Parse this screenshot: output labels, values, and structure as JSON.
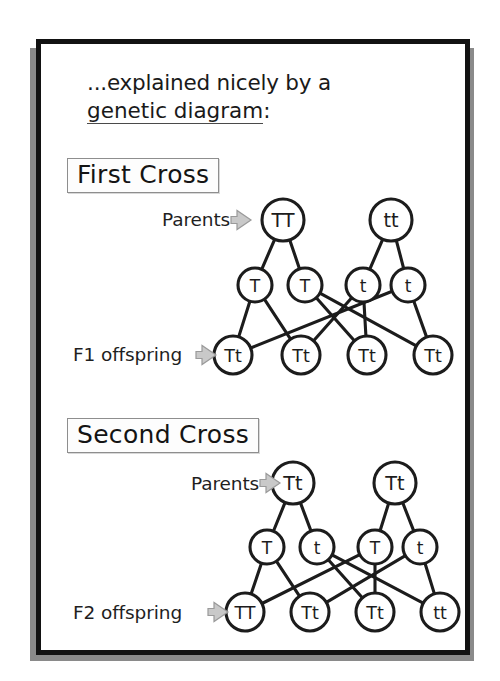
{
  "slide": {
    "headline_line1": "...explained nicely by a",
    "headline_line2": "genetic diagram",
    "headline_colon": ":",
    "sections": [
      {
        "id": "first",
        "title": "First  Cross"
      },
      {
        "id": "second",
        "title": "Second Cross"
      }
    ],
    "labels": {
      "parents_1": "Parents",
      "f1": "F1 offspring",
      "parents_2": "Parents",
      "f2": "F2 offspring"
    },
    "arrow_icon": "right-arrow-icon"
  },
  "colors": {
    "frame_border": "#121212",
    "frame_shadow": "#8a8a8a",
    "node_stroke": "#1c1c1c",
    "node_fill": "#ffffff",
    "arrow_fill": "#c9c9c9",
    "box_border": "#8e8e8e",
    "text": "#1a1a1a"
  },
  "chart_data": {
    "type": "diagram",
    "title": "genetic diagram",
    "crosses": [
      {
        "name": "First  Cross",
        "parents": [
          {
            "genotype": "TT",
            "x": 242,
            "y": 176
          },
          {
            "genotype": "tt",
            "x": 350,
            "y": 176
          }
        ],
        "gametes": [
          {
            "allele": "T",
            "x": 214,
            "y": 241
          },
          {
            "allele": "T",
            "x": 264,
            "y": 241
          },
          {
            "allele": "t",
            "x": 322,
            "y": 241
          },
          {
            "allele": "t",
            "x": 367,
            "y": 241
          }
        ],
        "offspring": [
          {
            "genotype": "Tt",
            "x": 192,
            "y": 311
          },
          {
            "genotype": "Tt",
            "x": 260,
            "y": 311
          },
          {
            "genotype": "Tt",
            "x": 326,
            "y": 311
          },
          {
            "genotype": "Tt",
            "x": 392,
            "y": 311
          }
        ],
        "parent_gamete_links": [
          [
            0,
            0
          ],
          [
            0,
            1
          ],
          [
            1,
            2
          ],
          [
            1,
            3
          ]
        ],
        "gamete_offspring_links": [
          [
            0,
            0
          ],
          [
            0,
            1
          ],
          [
            1,
            2
          ],
          [
            1,
            3
          ],
          [
            2,
            1
          ],
          [
            2,
            2
          ],
          [
            3,
            0
          ],
          [
            3,
            3
          ]
        ]
      },
      {
        "name": "Second Cross",
        "parents": [
          {
            "genotype": "Tt",
            "x": 252,
            "y": 439
          },
          {
            "genotype": "Tt",
            "x": 354,
            "y": 439
          }
        ],
        "gametes": [
          {
            "allele": "T",
            "x": 226,
            "y": 503
          },
          {
            "allele": "t",
            "x": 276,
            "y": 503
          },
          {
            "allele": "T",
            "x": 334,
            "y": 503
          },
          {
            "allele": "t",
            "x": 379,
            "y": 503
          }
        ],
        "offspring": [
          {
            "genotype": "TT",
            "x": 204,
            "y": 568
          },
          {
            "genotype": "Tt",
            "x": 269,
            "y": 568
          },
          {
            "genotype": "Tt",
            "x": 334,
            "y": 568
          },
          {
            "genotype": "tt",
            "x": 399,
            "y": 568
          }
        ],
        "parent_gamete_links": [
          [
            0,
            0
          ],
          [
            0,
            1
          ],
          [
            1,
            2
          ],
          [
            1,
            3
          ]
        ],
        "gamete_offspring_links": [
          [
            0,
            0
          ],
          [
            0,
            1
          ],
          [
            1,
            2
          ],
          [
            1,
            3
          ],
          [
            2,
            0
          ],
          [
            2,
            2
          ],
          [
            3,
            1
          ],
          [
            3,
            3
          ]
        ]
      }
    ],
    "node_radius": {
      "parent": 21,
      "gamete": 17,
      "offspring": 19
    }
  }
}
